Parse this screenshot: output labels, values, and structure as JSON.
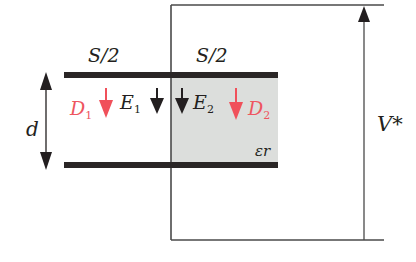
{
  "diagram": {
    "type": "parallel-plate capacitor, half filled with dielectric, connected to voltage source",
    "labels": {
      "left_area": "S/2",
      "right_area": "S/2",
      "gap": "d",
      "voltage": "V*",
      "dielectric": "εr",
      "D1_main": "D",
      "D1_sub": "1",
      "E1_main": "E",
      "E1_sub": "1",
      "E2_main": "E",
      "E2_sub": "2",
      "D2_main": "D",
      "D2_sub": "2"
    },
    "colors": {
      "plate": "#2a2626",
      "wire": "#4a4a4a",
      "dielectric_fill": "#dcdedc",
      "displacement_arrow": "#f0505a",
      "field_arrow": "#231f20",
      "text": "#231f20",
      "text_red": "#ee5560"
    }
  }
}
